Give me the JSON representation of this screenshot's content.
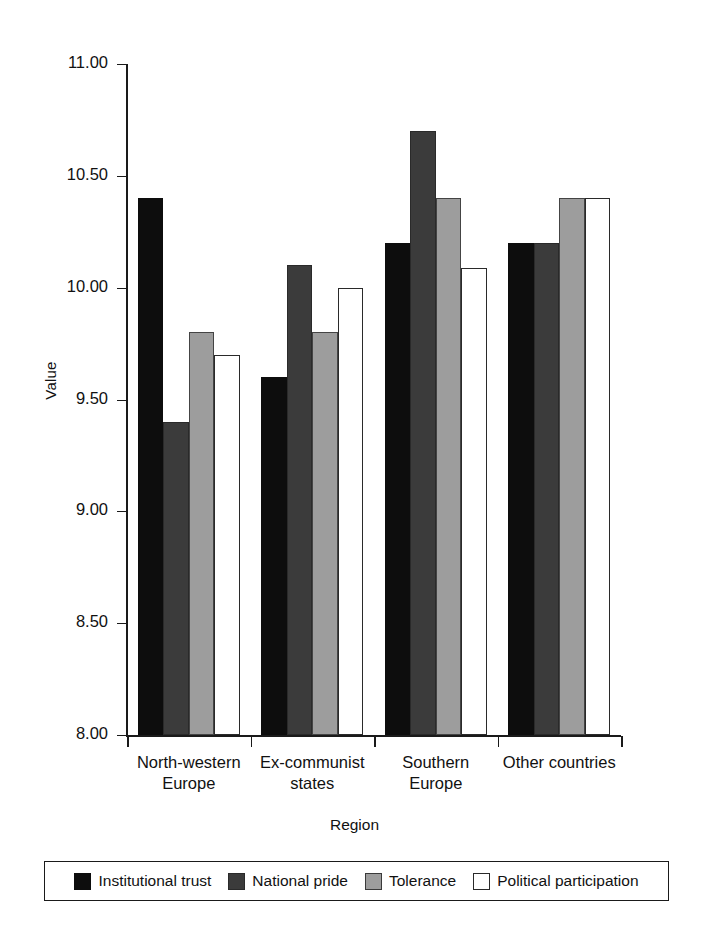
{
  "chart_data": {
    "type": "bar",
    "title": "",
    "xlabel": "Region",
    "ylabel": "Value",
    "ylim": [
      8.0,
      11.0
    ],
    "ytick_step": 0.5,
    "yticks": [
      "11.00",
      "10.50",
      "10.00",
      "9.50",
      "9.00",
      "8.50",
      "8.00"
    ],
    "ytick_values": [
      11.0,
      10.5,
      10.0,
      9.5,
      9.0,
      8.5,
      8.0
    ],
    "grid": false,
    "legend_position": "bottom",
    "categories": [
      "North-western\nEurope",
      "Ex-communist\nstates",
      "Southern\nEurope",
      "Other countries"
    ],
    "series": [
      {
        "name": "Institutional trust",
        "color": "#0d0d0d",
        "values": [
          10.4,
          9.6,
          10.2,
          10.2
        ]
      },
      {
        "name": "National pride",
        "color": "#3b3b3b",
        "values": [
          9.4,
          10.1,
          10.7,
          10.2
        ]
      },
      {
        "name": "Tolerance",
        "color": "#9d9d9d",
        "values": [
          9.8,
          9.8,
          10.4,
          10.4
        ]
      },
      {
        "name": "Political participation",
        "color": "#ffffff",
        "values": [
          9.7,
          10.0,
          10.09,
          10.4
        ]
      }
    ]
  }
}
